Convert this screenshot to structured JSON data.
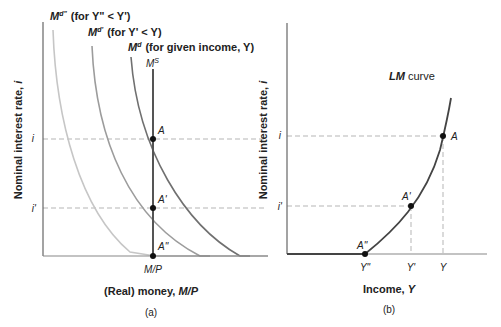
{
  "panel_a": {
    "caption": "(a)",
    "ylabel": "Nominal interest rate, i",
    "ylabel_prefix": "Nominal interest rate, ",
    "ylabel_var": "i",
    "xlabel_prefix": "(Real) money, ",
    "xlabel_var": "M/P",
    "x_tick": "M/P",
    "y_ticks": [
      "i",
      "i'"
    ],
    "supply_label": "M",
    "supply_sup": "S",
    "demand_curves": [
      {
        "name": "M",
        "sup": "d\"",
        "condition": "(for Y\" < Y')"
      },
      {
        "name": "M",
        "sup": "d'",
        "condition": "(for Y' < Y)"
      },
      {
        "name": "M",
        "sup": "d",
        "condition": "(for given income, Y)"
      }
    ],
    "points": [
      "A",
      "A'",
      "A\""
    ]
  },
  "panel_b": {
    "caption": "(b)",
    "ylabel": "Nominal interest rate, i",
    "ylabel_prefix": "Nominal interest rate, ",
    "ylabel_var": "i",
    "xlabel_prefix": "Income, ",
    "xlabel_var": "Y",
    "curve_label_var": "LM",
    "curve_label_rest": " curve",
    "x_ticks": [
      "Y\"",
      "Y'",
      "Y"
    ],
    "y_ticks": [
      "i",
      "i'"
    ],
    "points": [
      "A",
      "A'",
      "A\""
    ]
  },
  "colors": {
    "axis": "#555555",
    "supply": "#555555",
    "md": "#6e6e6e",
    "md1": "#9a9a9a",
    "md2": "#c4c4c4",
    "lm": "#444444",
    "dash": "#b0b0b0",
    "point": "#111111"
  }
}
